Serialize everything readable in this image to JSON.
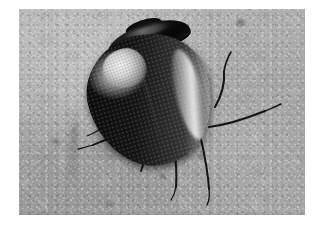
{
  "page": {
    "type": "photograph",
    "color_mode": "grayscale",
    "canvas": {
      "width": 324,
      "height": 230
    },
    "background_color": "#ffffff"
  },
  "photo": {
    "alt_text": "Close-up grayscale photograph of a dark shiny beetle on a gray concrete surface",
    "frame": {
      "x": 19,
      "y": 9,
      "width": 286,
      "height": 206
    },
    "substrate": {
      "name": "concrete-surface",
      "description": "mottled gray stone or concrete with fine grain and a dark vertical crack at lower left",
      "base_color": "#a6a6a6",
      "light_color": "#c9c9c9",
      "dark_color": "#8a8a8a"
    },
    "lighting": {
      "direction": "upper-left",
      "specular_highlight": "bright white patch on left shoulder of elytra",
      "rim_light": "narrow bright band along right edge of elytra"
    }
  },
  "subject": {
    "common_name": "beetle",
    "body_color": "#0a0a0a",
    "highlight_color": "#f2f2f2",
    "parts": [
      {
        "name": "head",
        "label": "head"
      },
      {
        "name": "pronotum",
        "label": "pronotum"
      },
      {
        "name": "elytra",
        "label": "elytra"
      },
      {
        "name": "elytral-suture",
        "label": "elytral suture"
      },
      {
        "name": "antenna-right",
        "label": "right antenna"
      },
      {
        "name": "antenna-left",
        "label": "left antenna"
      },
      {
        "name": "leg-front-left",
        "label": "front left leg"
      },
      {
        "name": "leg-mid-left",
        "label": "middle left leg"
      },
      {
        "name": "leg-hind-left",
        "label": "hind left leg"
      },
      {
        "name": "leg-mid-right",
        "label": "middle right leg"
      },
      {
        "name": "leg-hind-right",
        "label": "hind right leg"
      }
    ]
  }
}
